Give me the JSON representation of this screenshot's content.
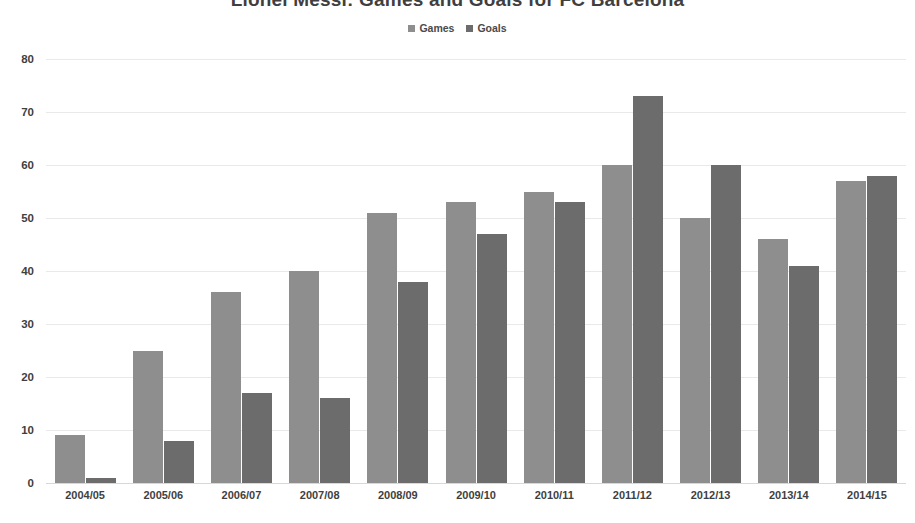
{
  "chart_data": {
    "type": "bar",
    "title": "Lionel Messi: Games and Goals for FC Barcelona",
    "xlabel": "",
    "ylabel": "",
    "ylim": [
      0,
      80
    ],
    "ytick_step": 10,
    "yticks": [
      80,
      70,
      60,
      50,
      40,
      30,
      20,
      10,
      0
    ],
    "grid": true,
    "legend_position": "top-center",
    "categories": [
      "2004/05",
      "2005/06",
      "2006/07",
      "2007/08",
      "2008/09",
      "2009/10",
      "2010/11",
      "2011/12",
      "2012/13",
      "2013/14",
      "2014/15"
    ],
    "series": [
      {
        "name": "Games",
        "color": "#8e8e8e",
        "values": [
          9,
          25,
          36,
          40,
          51,
          53,
          55,
          60,
          50,
          46,
          57
        ]
      },
      {
        "name": "Goals",
        "color": "#6c6c6c",
        "values": [
          1,
          8,
          17,
          16,
          38,
          47,
          53,
          73,
          60,
          41,
          58
        ]
      }
    ]
  }
}
